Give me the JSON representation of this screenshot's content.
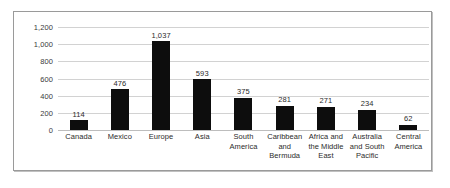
{
  "chart_data": {
    "type": "bar",
    "title": "",
    "subtitle": "",
    "xlabel": "",
    "ylabel": "",
    "ylim": [
      0,
      1200
    ],
    "ytick_labels": [
      "1,200",
      "1,000",
      "800",
      "600",
      "400",
      "200",
      "0"
    ],
    "ytick_values": [
      1200,
      1000,
      800,
      600,
      400,
      200,
      0
    ],
    "grid": true,
    "legend": "none",
    "bar_color": "#0d0d0d",
    "gridline_color": "#d2d2d2",
    "categories": [
      "Canada",
      "Mexico",
      "Europe",
      "Asia",
      "South America",
      "Caribbean and Bermuda",
      "Africa and the Middle East",
      "Australia and South Pacific",
      "Central America"
    ],
    "category_label_lines": [
      [
        "Canada"
      ],
      [
        "Mexico"
      ],
      [
        "Europe"
      ],
      [
        "Asia"
      ],
      [
        "South",
        "America"
      ],
      [
        "Caribbean",
        "and",
        "Bermuda"
      ],
      [
        "Africa and",
        "the Middle",
        "East"
      ],
      [
        "Australia",
        "and South",
        "Pacific"
      ],
      [
        "Central",
        "America"
      ]
    ],
    "values": [
      114,
      476,
      1037,
      593,
      375,
      281,
      271,
      234,
      62
    ],
    "value_labels": [
      "114",
      "476",
      "1,037",
      "593",
      "375",
      "281",
      "271",
      "234",
      "62"
    ]
  }
}
